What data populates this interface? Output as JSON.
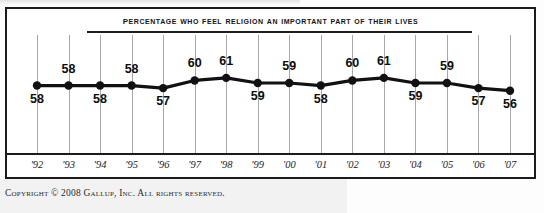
{
  "chart_data": {
    "type": "line",
    "title": "Percentage who feel religion an important part of their lives",
    "xlabel": "",
    "ylabel": "",
    "categories": [
      "'92",
      "'93",
      "'94",
      "'95",
      "'96",
      "'97",
      "'98",
      "'99",
      "'00",
      "'01",
      "'02",
      "'03",
      "'04",
      "'05",
      "'06",
      "'07"
    ],
    "x": [
      1992,
      1993,
      1994,
      1995,
      1996,
      1997,
      1998,
      1999,
      2000,
      2001,
      2002,
      2003,
      2004,
      2005,
      2006,
      2007
    ],
    "values": [
      58,
      58,
      58,
      58,
      57,
      60,
      61,
      59,
      59,
      58,
      60,
      61,
      59,
      59,
      57,
      56
    ],
    "point_labels": [
      "58",
      "58",
      "58",
      "58",
      "57",
      "60",
      "61",
      "59",
      "59",
      "58",
      "60",
      "61",
      "59",
      "59",
      "57",
      "56"
    ],
    "label_positions": [
      "below",
      "above",
      "below",
      "above",
      "below",
      "above",
      "above",
      "below",
      "above",
      "below",
      "above",
      "above",
      "below",
      "above",
      "below",
      "below"
    ],
    "ylim": [
      52,
      66
    ],
    "grid": true,
    "grid_orientation": "vertical",
    "legend": "none",
    "series_color": "#111111",
    "gridline_color": "#a8a8a8",
    "frame_color": "#1b1b1b"
  },
  "footer": {
    "copyright": "Copyright © 2008 Gallup, Inc. All rights reserved."
  }
}
